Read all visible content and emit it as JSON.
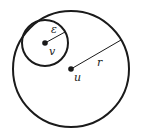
{
  "diagram": {
    "labels": {
      "epsilon": "ε",
      "v": "v",
      "u": "u",
      "r": "r"
    },
    "colors": {
      "stroke": "#1a1a1a",
      "background": "#ffffff"
    }
  }
}
